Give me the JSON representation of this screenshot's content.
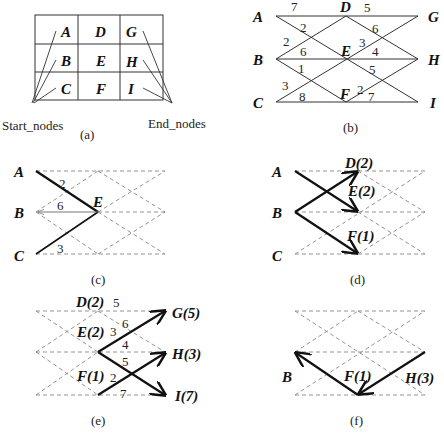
{
  "panels": {
    "a": {
      "caption": "(a)",
      "grid": [
        [
          "A",
          "D",
          "G"
        ],
        [
          "B",
          "E",
          "H"
        ],
        [
          "C",
          "F",
          "I"
        ]
      ],
      "start_label": "Start_nodes",
      "end_label": "End_nodes"
    },
    "b": {
      "caption": "(b)",
      "nodes": {
        "A": "A",
        "B": "B",
        "C": "C",
        "D": "D",
        "E": "E",
        "F": "F",
        "G": "G",
        "H": "H",
        "I": "I"
      },
      "edges": [
        {
          "from": "A",
          "to": "D",
          "w": "7"
        },
        {
          "from": "A",
          "to": "E",
          "w": "2"
        },
        {
          "from": "B",
          "to": "D",
          "w": "2"
        },
        {
          "from": "B",
          "to": "E",
          "w": "6"
        },
        {
          "from": "B",
          "to": "F",
          "w": "1"
        },
        {
          "from": "C",
          "to": "E",
          "w": "3"
        },
        {
          "from": "C",
          "to": "F",
          "w": "8"
        },
        {
          "from": "D",
          "to": "G",
          "w": "5"
        },
        {
          "from": "D",
          "to": "H",
          "w": "6"
        },
        {
          "from": "E",
          "to": "G",
          "w": "3"
        },
        {
          "from": "E",
          "to": "H",
          "w": "4"
        },
        {
          "from": "E",
          "to": "I",
          "w": "5"
        },
        {
          "from": "F",
          "to": "H",
          "w": "2"
        },
        {
          "from": "F",
          "to": "I",
          "w": "7"
        }
      ]
    },
    "c": {
      "caption": "(c)",
      "labels": {
        "A": "A",
        "B": "B",
        "C": "C",
        "E": "E"
      },
      "weights": {
        "AE": "2",
        "BE": "6",
        "CE": "3"
      }
    },
    "d": {
      "caption": "(d)",
      "labels": {
        "A": "A",
        "B": "B",
        "C": "C",
        "D": "D(2)",
        "E": "E(2)",
        "F": "F(1)"
      }
    },
    "e": {
      "caption": "(e)",
      "labels": {
        "D": "D(2)",
        "E": "E(2)",
        "F": "F(1)",
        "G": "G(5)",
        "H": "H(3)",
        "I": "I(7)"
      },
      "weights": {
        "DG": "5",
        "DH": "6",
        "EG": "3",
        "EH": "4",
        "EI": "5",
        "FH": "2",
        "FI": "7"
      }
    },
    "f": {
      "caption": "(f)",
      "labels": {
        "B": "B",
        "F": "F(1)",
        "H": "H(3)"
      }
    }
  }
}
